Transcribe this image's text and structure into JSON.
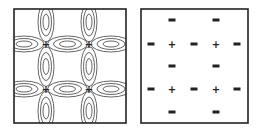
{
  "panels": [
    {
      "name": "orbital-contour-panel",
      "description": "contour lobes around four + nodes",
      "centers": [
        {
          "label": "+",
          "row": 0,
          "col": 0
        },
        {
          "label": "+",
          "row": 0,
          "col": 1
        },
        {
          "label": "+",
          "row": 1,
          "col": 0
        },
        {
          "label": "+",
          "row": 1,
          "col": 1
        }
      ]
    },
    {
      "name": "sign-pattern-panel",
      "rows": [
        [
          "",
          "-",
          "",
          "-",
          ""
        ],
        [
          "-",
          "+",
          "-",
          "+",
          "-"
        ],
        [
          "",
          "-",
          "",
          "-",
          ""
        ],
        [
          "-",
          "+",
          "-",
          "+",
          "-"
        ],
        [
          "",
          "-",
          "",
          "-",
          ""
        ]
      ]
    }
  ],
  "colors": {
    "line": "#222222",
    "contour": "#555555",
    "background": "#ffffff"
  }
}
